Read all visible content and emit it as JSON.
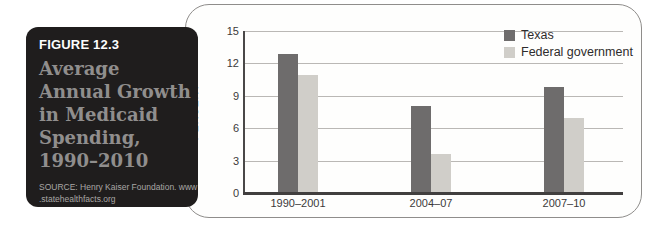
{
  "panel": {
    "figure_label": "FIGURE 12.3",
    "title_lines": [
      "Average",
      "Annual Growth",
      "in Medicaid",
      "Spending,",
      "1990–2010"
    ],
    "source_lines": [
      "SOURCE: Henry Kaiser Foundation. www",
      ".statehealthfacts.org"
    ],
    "bg_color": "#1f1d1d",
    "title_color": "#908e8d"
  },
  "chart_data": {
    "type": "bar",
    "title": "",
    "xlabel": "",
    "ylabel": "PERCENT",
    "ylim": [
      0,
      15
    ],
    "yticks": [
      0,
      3,
      6,
      9,
      12,
      15
    ],
    "grid": true,
    "legend_position": "top-right",
    "categories": [
      "1990–2001",
      "2004–07",
      "2007–10"
    ],
    "series": [
      {
        "name": "Texas",
        "color": "#6e6c6c",
        "values": [
          12.9,
          8.1,
          9.8
        ]
      },
      {
        "name": "Federal government",
        "color": "#d0cec9",
        "values": [
          10.9,
          3.6,
          6.9
        ]
      }
    ]
  }
}
